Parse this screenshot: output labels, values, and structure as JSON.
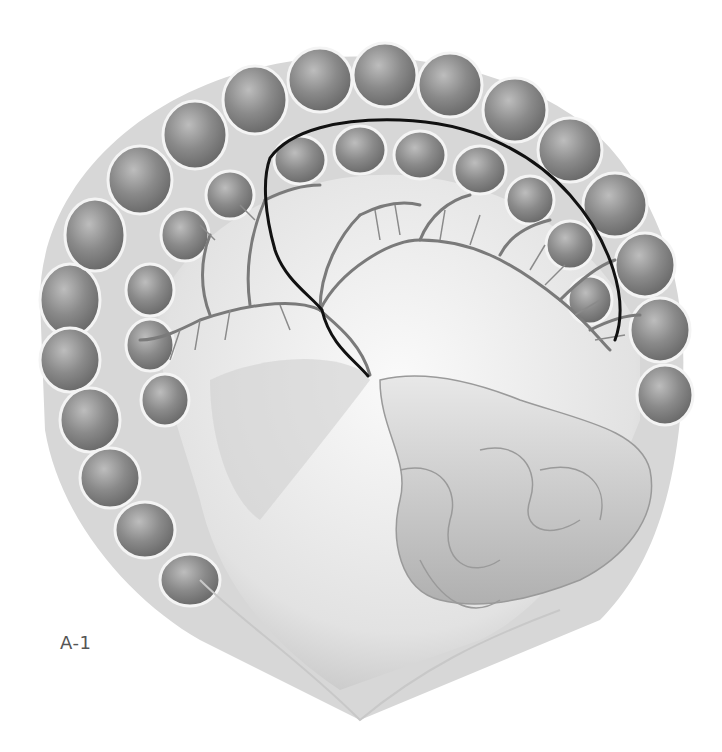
{
  "figure": {
    "label": "A-1",
    "colors": {
      "background": "#ffffff",
      "tissue_dark": "#6e6e6e",
      "tissue_mid": "#9a9a9a",
      "tissue_light": "#d9d9d9",
      "vessel": "#7a7a7a",
      "incision_line": "#111111",
      "label_text": "#555555"
    }
  }
}
